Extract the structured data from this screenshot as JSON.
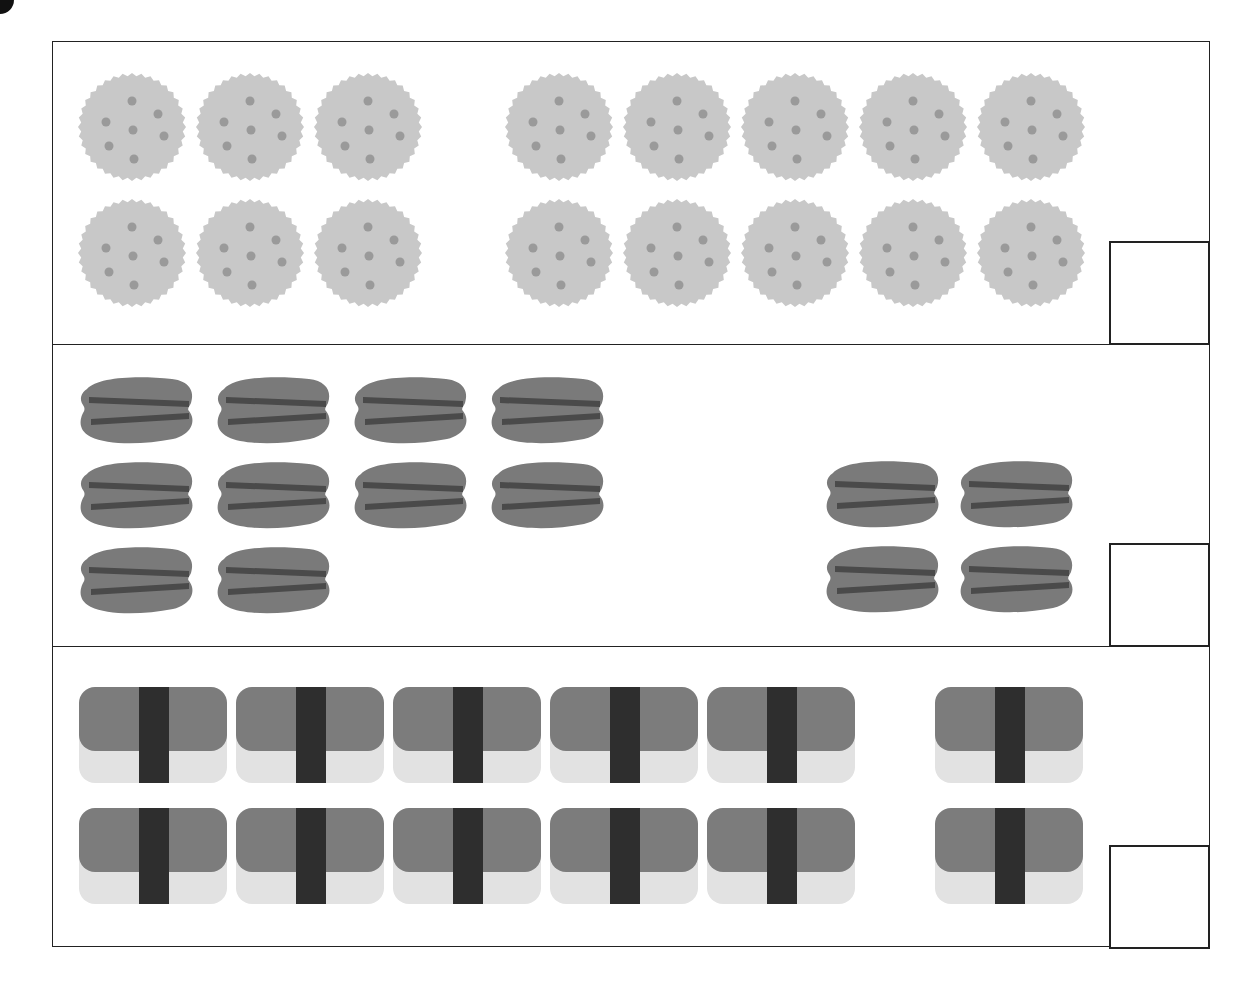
{
  "worksheet": {
    "type": "counting-addition",
    "problems": [
      {
        "id": "crackers",
        "item": "cracker",
        "groups": [
          {
            "count": 6,
            "columns": 3,
            "rows": 2
          },
          {
            "count": 10,
            "columns": 5,
            "rows": 2
          }
        ],
        "answer": ""
      },
      {
        "id": "macarons",
        "item": "macaron",
        "groups": [
          {
            "count": 10,
            "columns": 4,
            "rows": 3
          },
          {
            "count": 4,
            "columns": 2,
            "rows": 2
          }
        ],
        "answer": ""
      },
      {
        "id": "sushi",
        "item": "nigiri-sushi",
        "groups": [
          {
            "count": 10,
            "columns": 5,
            "rows": 2
          },
          {
            "count": 2,
            "columns": 1,
            "rows": 2
          }
        ],
        "answer": ""
      }
    ]
  },
  "colors": {
    "border": "#222222",
    "cracker": "#c8c8c8",
    "cracker_dots": "#9a9a9a",
    "macaron": "#7a7a7a",
    "macaron_filling": "#4a4a4a",
    "sushi_top": "#7c7c7c",
    "sushi_rice": "#e2e2e2",
    "nori": "#2e2e2e"
  }
}
